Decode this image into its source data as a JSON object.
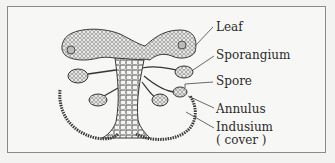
{
  "figure": {
    "type": "fern sorus cross-section",
    "labels": [
      {
        "id": "leaf",
        "text": "Leaf"
      },
      {
        "id": "sporangium",
        "text": "Sporangium"
      },
      {
        "id": "spore",
        "text": "Spore"
      },
      {
        "id": "annulus",
        "text": "Annulus"
      },
      {
        "id": "indusium",
        "text": "Indusium"
      },
      {
        "id": "indusium_note",
        "text": "( cover )"
      }
    ]
  },
  "colors": {
    "ink": "#3a3a3a",
    "frame": "#8a8a8a",
    "background": "#f7f7f5"
  }
}
